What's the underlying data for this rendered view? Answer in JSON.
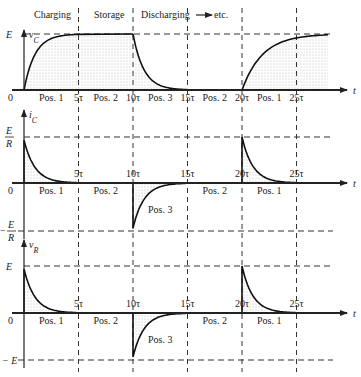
{
  "header": {
    "phases": [
      "Charging",
      "Storage",
      "Discharging",
      "etc."
    ]
  },
  "time_ticks": [
    "0",
    "5τ",
    "10τ",
    "15τ",
    "20τ",
    "25τ"
  ],
  "t_label": "t",
  "positions": [
    "Pos. 1",
    "Pos. 2",
    "Pos. 3",
    "Pos. 2",
    "Pos. 1"
  ],
  "graphs": [
    {
      "name": "vC",
      "ylabel": "v",
      "ylabel_sub": "C",
      "top_label": "E",
      "bottom_label": "",
      "zero_label": "0"
    },
    {
      "name": "iC",
      "ylabel": "i",
      "ylabel_sub": "C",
      "top_label_num": "E",
      "top_label_den": "R",
      "bottom_label_num": "E",
      "bottom_label_den": "R",
      "bottom_sign": "−",
      "zero_label": "0"
    },
    {
      "name": "vR",
      "ylabel": "v",
      "ylabel_sub": "R",
      "top_label": "E",
      "bottom_label": "− E",
      "zero_label": "0"
    }
  ],
  "chart_data": [
    {
      "type": "line",
      "title": "Capacitor voltage v_C",
      "xlabel": "t",
      "ylabel": "v_C",
      "x_ticks": [
        "0",
        "5τ",
        "10τ",
        "15τ",
        "20τ",
        "25τ"
      ],
      "ylim": [
        0,
        "E"
      ],
      "segments": [
        {
          "phase": "Pos. 1 (Charging)",
          "from": "0",
          "to": "5τ",
          "shape": "E(1 − e^(−t/τ))"
        },
        {
          "phase": "Pos. 2 (Storage)",
          "from": "5τ",
          "to": "10τ",
          "shape": "E constant"
        },
        {
          "phase": "Pos. 3 (Discharging)",
          "from": "10τ",
          "to": "15τ",
          "shape": "E·e^(−t/τ)"
        },
        {
          "phase": "Pos. 2",
          "from": "15τ",
          "to": "20τ",
          "shape": "0"
        },
        {
          "phase": "Pos. 1",
          "from": "20τ",
          "to": "25τ+",
          "shape": "E(1 − e^(−t/τ))"
        }
      ]
    },
    {
      "type": "line",
      "title": "Capacitor current i_C",
      "xlabel": "t",
      "ylabel": "i_C",
      "ylim": [
        "-E/R",
        "E/R"
      ],
      "segments": [
        {
          "phase": "Pos. 1",
          "from": "0",
          "to": "5τ",
          "shape": "(E/R)e^(−t/τ)"
        },
        {
          "phase": "Pos. 2",
          "from": "5τ",
          "to": "10τ",
          "shape": "0"
        },
        {
          "phase": "Pos. 3",
          "from": "10τ",
          "to": "15τ",
          "shape": "−(E/R)e^(−t/τ)"
        },
        {
          "phase": "Pos. 2",
          "from": "15τ",
          "to": "20τ",
          "shape": "0"
        },
        {
          "phase": "Pos. 1",
          "from": "20τ",
          "to": "25τ",
          "shape": "(E/R)e^(−t/τ)"
        }
      ]
    },
    {
      "type": "line",
      "title": "Resistor voltage v_R",
      "xlabel": "t",
      "ylabel": "v_R",
      "ylim": [
        "-E",
        "E"
      ],
      "segments": [
        {
          "phase": "Pos. 1",
          "from": "0",
          "to": "5τ",
          "shape": "E·e^(−t/τ)"
        },
        {
          "phase": "Pos. 2",
          "from": "5τ",
          "to": "10τ",
          "shape": "0"
        },
        {
          "phase": "Pos. 3",
          "from": "10τ",
          "to": "15τ",
          "shape": "−E·e^(−t/τ)"
        },
        {
          "phase": "Pos. 2",
          "from": "15τ",
          "to": "20τ",
          "shape": "0"
        },
        {
          "phase": "Pos. 1",
          "from": "20τ",
          "to": "25τ",
          "shape": "E·e^(−t/τ)"
        }
      ]
    }
  ]
}
